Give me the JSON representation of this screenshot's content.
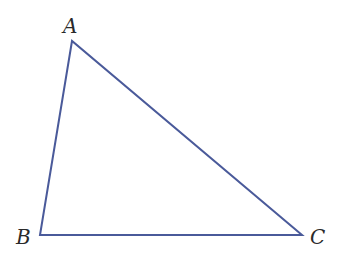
{
  "diagram": {
    "type": "triangle",
    "stroke_color": "#4a5a9a",
    "vertices": [
      {
        "label": "A",
        "x": 72,
        "y": 41
      },
      {
        "label": "B",
        "x": 40,
        "y": 235
      },
      {
        "label": "C",
        "x": 302,
        "y": 235
      }
    ],
    "labels": {
      "A": "A",
      "B": "B",
      "C": "C"
    }
  }
}
